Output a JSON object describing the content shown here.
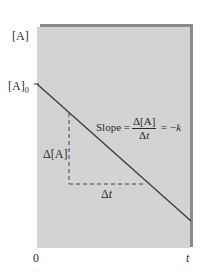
{
  "chart_data": {
    "type": "line",
    "title": "",
    "xlabel": "t",
    "ylabel": "[A]",
    "x_origin_label": "0",
    "y_intercept_label": "[A]",
    "y_intercept_subscript": "0",
    "series": [
      {
        "name": "[A] vs t (zero-order)",
        "x": [
          0,
          1
        ],
        "y": [
          1,
          0.38
        ],
        "style": "solid"
      }
    ],
    "annotations": {
      "delta_y_label": "Δ[A]",
      "delta_x_label": "Δt",
      "slope_text": "Slope =",
      "slope_numerator": "Δ[A]",
      "slope_denominator": "Δt",
      "slope_equals": "= −k"
    },
    "grid": false,
    "legend": "none",
    "colors": {
      "panel_background": "#d3d3d3",
      "panel_shadow": "#8a8a8a",
      "line": "#3a3a3a",
      "text": "#2a2a2a"
    }
  }
}
